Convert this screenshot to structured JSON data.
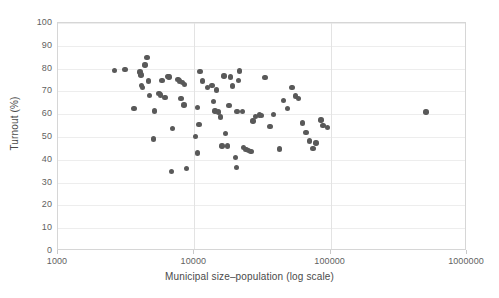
{
  "chart_data": {
    "type": "scatter",
    "title": "",
    "xlabel": "Municipal size–population (log scale)",
    "ylabel": "Turnout (%)",
    "x_scale": "log",
    "xlim": [
      1000,
      1000000
    ],
    "ylim": [
      0,
      100
    ],
    "xticks": [
      1000,
      10000,
      100000,
      1000000
    ],
    "xtick_labels": [
      "1000",
      "10000",
      "100000",
      "1000000"
    ],
    "yticks": [
      0,
      10,
      20,
      30,
      40,
      50,
      60,
      70,
      80,
      90,
      100
    ],
    "ytick_labels": [
      "0",
      "10",
      "20",
      "30",
      "40",
      "50",
      "60",
      "70",
      "80",
      "90",
      "100"
    ],
    "grid": "both-light",
    "legend": "none",
    "marker_color": "#595959",
    "marker_size": 5.4,
    "series": [
      {
        "name": "Municipalities",
        "points": [
          [
            2600,
            79.2
          ],
          [
            3100,
            79.6
          ],
          [
            4000,
            78.5
          ],
          [
            4050,
            77.2
          ],
          [
            4100,
            72.7
          ],
          [
            4150,
            71.6
          ],
          [
            4350,
            81.5
          ],
          [
            4500,
            84.9
          ],
          [
            4600,
            74.6
          ],
          [
            4700,
            68.3
          ],
          [
            3600,
            62.6
          ],
          [
            5100,
            61.4
          ],
          [
            5000,
            49.2
          ],
          [
            5800,
            74.8
          ],
          [
            5500,
            69.1
          ],
          [
            5650,
            68.4
          ],
          [
            6400,
            76.6
          ],
          [
            6500,
            76.4
          ],
          [
            6100,
            67.3
          ],
          [
            6900,
            53.7
          ],
          [
            6800,
            35.0
          ],
          [
            8800,
            36.3
          ],
          [
            7600,
            75.3
          ],
          [
            7800,
            74.6
          ],
          [
            8200,
            73.8
          ],
          [
            8500,
            73.0
          ],
          [
            8000,
            67.0
          ],
          [
            8400,
            64.0
          ],
          [
            11000,
            78.8
          ],
          [
            11500,
            74.5
          ],
          [
            12500,
            71.6
          ],
          [
            10500,
            62.9
          ],
          [
            10800,
            55.5
          ],
          [
            10200,
            50.1
          ],
          [
            10600,
            43.0
          ],
          [
            13500,
            72.7
          ],
          [
            14500,
            70.7
          ],
          [
            13800,
            65.6
          ],
          [
            14200,
            61.4
          ],
          [
            15000,
            61.0
          ],
          [
            15500,
            58.7
          ],
          [
            16000,
            46.0
          ],
          [
            17500,
            46.0
          ],
          [
            16500,
            76.8
          ],
          [
            18500,
            76.4
          ],
          [
            19000,
            72.3
          ],
          [
            18000,
            63.9
          ],
          [
            17000,
            51.5
          ],
          [
            20500,
            61.2
          ],
          [
            21000,
            74.9
          ],
          [
            21500,
            79.0
          ],
          [
            22500,
            61.2
          ],
          [
            20000,
            41.0
          ],
          [
            20400,
            36.6
          ],
          [
            23000,
            45.4
          ],
          [
            24000,
            44.6
          ],
          [
            25000,
            44.0
          ],
          [
            26000,
            43.7
          ],
          [
            28000,
            58.9
          ],
          [
            27000,
            57.0
          ],
          [
            30000,
            59.7
          ],
          [
            31000,
            59.4
          ],
          [
            33000,
            76.2
          ],
          [
            36000,
            54.5
          ],
          [
            38000,
            60.0
          ],
          [
            42000,
            44.7
          ],
          [
            45000,
            65.9
          ],
          [
            48000,
            62.6
          ],
          [
            52000,
            71.8
          ],
          [
            55000,
            68.0
          ],
          [
            58000,
            66.8
          ],
          [
            62000,
            56.1
          ],
          [
            66000,
            52.0
          ],
          [
            70000,
            48.2
          ],
          [
            74000,
            44.9
          ],
          [
            78000,
            47.3
          ],
          [
            85000,
            57.5
          ],
          [
            88000,
            55.0
          ],
          [
            95000,
            54.3
          ],
          [
            500000,
            61.0
          ]
        ]
      }
    ]
  }
}
